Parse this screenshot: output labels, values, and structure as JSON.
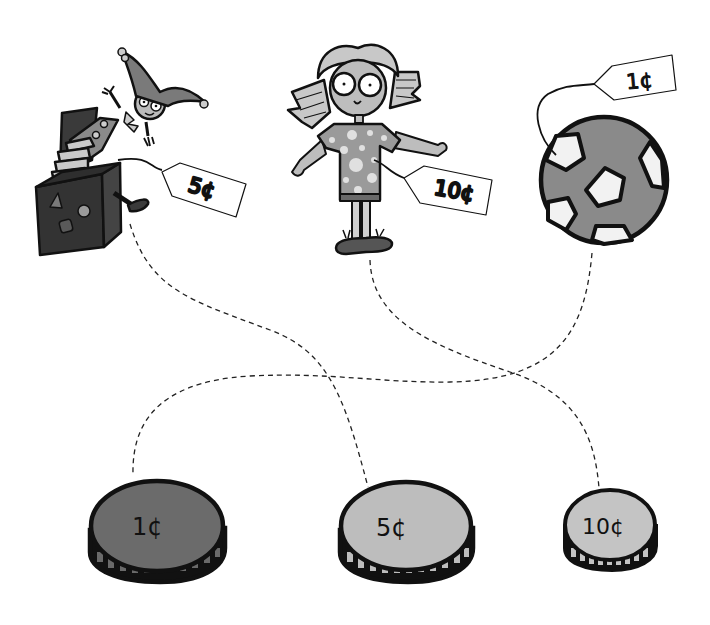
{
  "activity": {
    "type": "match-price-to-coin",
    "items": [
      {
        "id": "jack-in-the-box",
        "price_label": "5¢",
        "matches_coin": "5¢"
      },
      {
        "id": "girl-doll",
        "price_label": "10¢",
        "matches_coin": "10¢"
      },
      {
        "id": "soccer-ball",
        "price_label": "1¢",
        "matches_coin": "1¢"
      }
    ],
    "coins": [
      {
        "label": "1¢",
        "color": "#6b6b6b"
      },
      {
        "label": "5¢",
        "color": "#bdbdbd"
      },
      {
        "label": "10¢",
        "color": "#c4c4c4"
      }
    ]
  },
  "tags": {
    "jack": "5¢",
    "girl": "10¢",
    "ball": "1¢"
  },
  "coin_labels": {
    "one": "1¢",
    "five": "5¢",
    "ten": "10¢"
  },
  "colors": {
    "outline": "#111111",
    "dark_box": "#3a3a3a",
    "mid_grey": "#8a8a8a",
    "light_grey": "#c8c8c8",
    "dashed_line": "#222222"
  }
}
